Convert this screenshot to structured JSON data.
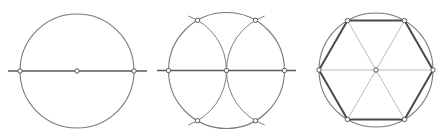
{
  "diagram": {
    "title": "Construction of a regular hexagon inscribed in a circle",
    "colors": {
      "background": "#ffffff",
      "circle": "#7a7a7a",
      "construction_arc": "#7f7f7f",
      "axis_line": "#5a5a5a",
      "diagonal": "#bdbdbd",
      "hexagon_edge": "#4a4a4a",
      "point_stroke": "#555555",
      "point_fill": "#ffffff"
    },
    "steps": [
      {
        "id": "step-1",
        "description": "Circle with horizontal diameter; center and diameter endpoints marked",
        "circle": {
          "cx": 77,
          "cy": 71,
          "r": 57
        },
        "line": {
          "x1": 8,
          "y1": 71,
          "x2": 147,
          "y2": 71
        },
        "points": [
          {
            "x": 20,
            "y": 71
          },
          {
            "x": 77,
            "y": 71
          },
          {
            "x": 134,
            "y": 71
          }
        ]
      },
      {
        "id": "step-2",
        "description": "Arcs of the same radius drawn from both diameter endpoints, intersecting the circle at four points",
        "circle": {
          "cx": 226.5,
          "cy": 70.5,
          "r": 58
        },
        "line": {
          "x1": 157,
          "y1": 70.5,
          "x2": 296,
          "y2": 70.5
        },
        "arcs": [
          {
            "cx": 168.5,
            "cy": 70.5,
            "r": 58
          },
          {
            "cx": 284.5,
            "cy": 70.5,
            "r": 58
          }
        ],
        "points": [
          {
            "x": 168.5,
            "y": 70.5
          },
          {
            "x": 226.5,
            "y": 70.5
          },
          {
            "x": 284.5,
            "y": 70.5
          },
          {
            "x": 197.5,
            "y": 20.3
          },
          {
            "x": 255.5,
            "y": 20.3
          },
          {
            "x": 197.5,
            "y": 120.7
          },
          {
            "x": 255.5,
            "y": 120.7
          }
        ]
      },
      {
        "id": "step-3",
        "description": "Six points joined to form a regular hexagon; diagonals through the center",
        "circle": {
          "cx": 376,
          "cy": 70,
          "r": 57
        },
        "center": {
          "x": 376,
          "y": 70
        },
        "vertices": [
          {
            "x": 319,
            "y": 70
          },
          {
            "x": 347.5,
            "y": 20.6
          },
          {
            "x": 404.5,
            "y": 20.6
          },
          {
            "x": 433,
            "y": 70
          },
          {
            "x": 404.5,
            "y": 119.4
          },
          {
            "x": 347.5,
            "y": 119.4
          }
        ]
      }
    ]
  }
}
